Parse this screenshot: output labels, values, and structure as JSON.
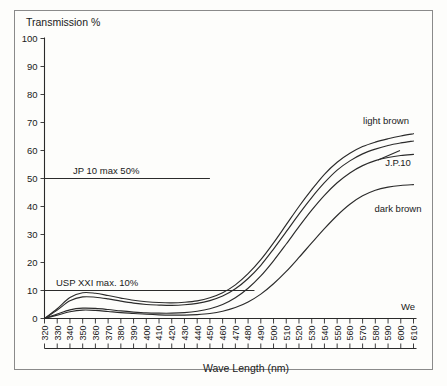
{
  "figure": {
    "border_color": "#8a8a8a",
    "background": "#fdfdfb",
    "ink_color": "#2b2b2b"
  },
  "labels": {
    "y_axis_title": "Transmission %",
    "x_axis_title": "Wave Length (nm)",
    "jp10_limit": "JP 10 max 50%",
    "usp_limit": "USP XXI max. 10%",
    "light_brown": "light brown",
    "jp10_curve": "J.P.10",
    "dark_brown": "dark brown",
    "we": "We"
  },
  "chart_data": {
    "type": "line",
    "title": "",
    "xlabel": "Wave Length (nm)",
    "ylabel": "Transmission %",
    "xlim": [
      320,
      610
    ],
    "ylim": [
      0,
      100
    ],
    "grid": false,
    "legend": "inline-annotations",
    "x_ticks": [
      320,
      330,
      340,
      350,
      360,
      370,
      380,
      390,
      400,
      410,
      420,
      430,
      440,
      450,
      460,
      470,
      480,
      490,
      500,
      510,
      520,
      530,
      540,
      550,
      560,
      570,
      580,
      590,
      600,
      610
    ],
    "y_ticks": [
      0,
      10,
      20,
      30,
      40,
      50,
      60,
      70,
      80,
      90,
      100
    ],
    "x": [
      320,
      330,
      340,
      350,
      360,
      370,
      380,
      390,
      400,
      410,
      420,
      430,
      440,
      450,
      460,
      470,
      480,
      490,
      500,
      510,
      520,
      530,
      540,
      550,
      560,
      570,
      580,
      590,
      600,
      610
    ],
    "series": [
      {
        "name": "light brown",
        "label": "light brown",
        "values": [
          0,
          3.5,
          7.5,
          9.2,
          9.0,
          8.2,
          7.3,
          6.5,
          6.0,
          5.7,
          5.6,
          5.8,
          6.3,
          7.4,
          9.2,
          12.0,
          16.0,
          21.0,
          27.0,
          33.5,
          40.0,
          46.0,
          51.5,
          55.8,
          59.0,
          61.4,
          63.0,
          64.2,
          65.2,
          66.0
        ]
      },
      {
        "name": "second curve",
        "label": "",
        "values": [
          0,
          3.0,
          6.3,
          7.7,
          7.6,
          7.0,
          6.2,
          5.5,
          5.0,
          4.8,
          4.7,
          4.9,
          5.4,
          6.4,
          8.0,
          10.6,
          14.3,
          19.0,
          24.8,
          31.0,
          37.3,
          43.2,
          48.5,
          53.0,
          56.3,
          58.8,
          60.5,
          61.8,
          62.7,
          63.4
        ]
      },
      {
        "name": "J.P.10",
        "label": "J.P.10",
        "values": [
          0,
          1.6,
          3.1,
          3.7,
          3.6,
          3.2,
          2.7,
          2.3,
          2.0,
          1.9,
          1.9,
          2.1,
          2.6,
          3.5,
          5.0,
          7.4,
          10.8,
          15.2,
          20.6,
          26.6,
          32.8,
          38.7,
          44.0,
          48.5,
          52.0,
          54.6,
          56.4,
          57.5,
          58.2,
          58.6
        ]
      },
      {
        "name": "dark brown",
        "label": "dark brown",
        "values": [
          0,
          1.2,
          2.4,
          3.0,
          2.9,
          2.5,
          2.1,
          1.8,
          1.5,
          1.3,
          1.2,
          1.2,
          1.4,
          1.8,
          2.6,
          3.9,
          5.9,
          8.7,
          12.4,
          16.8,
          21.8,
          27.0,
          32.1,
          36.8,
          40.8,
          43.8,
          45.8,
          46.9,
          47.5,
          47.8
        ]
      }
    ],
    "reference_lines": [
      {
        "name": "jp10_limit",
        "label": "JP 10 max 50%",
        "y": 50,
        "x_start": 320,
        "x_end": 450
      },
      {
        "name": "usp_limit",
        "label": "USP XXI max. 10%",
        "y": 10,
        "x_start": 320,
        "x_end": 485
      }
    ]
  }
}
